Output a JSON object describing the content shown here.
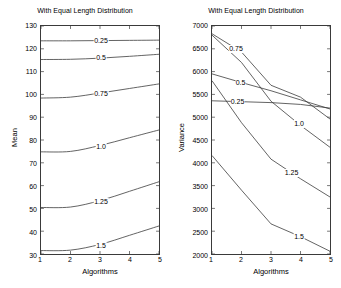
{
  "figure": {
    "width": 341,
    "height": 288,
    "background": "#ffffff",
    "line_color": "#3a3a3a"
  },
  "chart_data": [
    {
      "type": "line",
      "id": "mean-chart",
      "title": "With Equal Length Distribution",
      "xlabel": "Algorithms",
      "ylabel": "Mean",
      "x": [
        1,
        2,
        3,
        4,
        5
      ],
      "xlim": [
        1,
        5
      ],
      "ylim": [
        30,
        130
      ],
      "xticks": [
        1,
        2,
        3,
        4,
        5
      ],
      "yticks": [
        30,
        40,
        50,
        60,
        70,
        80,
        90,
        100,
        110,
        120,
        130
      ],
      "grid": false,
      "legend_position": "inline-labels",
      "series": [
        {
          "name": "0.25",
          "values": [
            123.5,
            123.5,
            123.6,
            123.7,
            123.8
          ],
          "label_x": 3.0
        },
        {
          "name": "0.5",
          "values": [
            115.3,
            115.4,
            115.9,
            116.7,
            117.6
          ],
          "label_x": 3.0
        },
        {
          "name": "0.75",
          "values": [
            98.4,
            98.8,
            100.6,
            102.6,
            104.6
          ],
          "label_x": 3.0
        },
        {
          "name": "1.0",
          "values": [
            74.8,
            75.0,
            77.6,
            81.0,
            84.4
          ],
          "label_x": 3.0
        },
        {
          "name": "1.25",
          "values": [
            50.4,
            50.6,
            53.4,
            57.5,
            61.7
          ],
          "label_x": 3.0
        },
        {
          "name": "1.5",
          "values": [
            31.5,
            31.7,
            34.2,
            38.2,
            42.3
          ],
          "label_x": 3.0
        }
      ]
    },
    {
      "type": "line",
      "id": "variance-chart",
      "title": "With Equal Length Distribution",
      "xlabel": "Algorithms",
      "ylabel": "Variance",
      "x": [
        1,
        2,
        3,
        4,
        5
      ],
      "xlim": [
        1,
        5
      ],
      "ylim": [
        2000,
        7000
      ],
      "xticks": [
        1,
        2,
        3,
        4,
        5
      ],
      "yticks": [
        2000,
        2500,
        3000,
        3500,
        4000,
        4500,
        5000,
        5500,
        6000,
        6500,
        7000
      ],
      "grid": false,
      "legend_position": "inline-labels",
      "series": [
        {
          "name": "0.25",
          "values": [
            5360,
            5340,
            5320,
            5280,
            5200
          ],
          "label_x": 1.85
        },
        {
          "name": "0.5",
          "values": [
            5950,
            5760,
            5580,
            5380,
            5180
          ],
          "label_x": 1.95
        },
        {
          "name": "0.75",
          "values": [
            6830,
            6430,
            5700,
            5440,
            4960
          ],
          "label_x": 1.8
        },
        {
          "name": "1.0",
          "values": [
            6800,
            6200,
            5350,
            4820,
            4340
          ],
          "label_x": 3.9
        },
        {
          "name": "1.25",
          "values": [
            5800,
            4880,
            4080,
            3650,
            3250
          ],
          "label_x": 3.65
        },
        {
          "name": "1.5",
          "values": [
            4160,
            3400,
            2660,
            2380,
            2060
          ],
          "label_x": 3.9
        }
      ]
    }
  ]
}
